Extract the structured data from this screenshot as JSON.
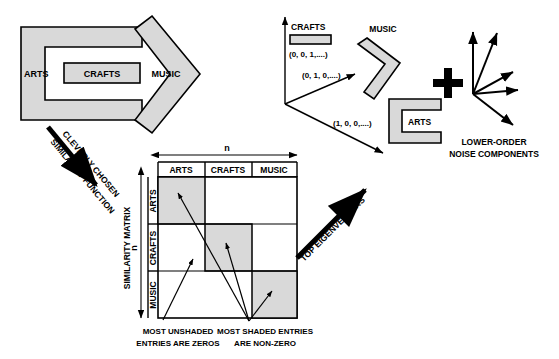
{
  "figure": {
    "title_present": false,
    "background": "#ffffff",
    "shade_color": "#d9d9d9",
    "stroke_color": "#000000"
  },
  "left_panel": {
    "name": "interlocking-shapes-group",
    "shapes": [
      {
        "id": "arts-c-shape",
        "label": "ARTS",
        "glyph": "c-bracket"
      },
      {
        "id": "crafts-bar-shape",
        "label": "CRAFTS",
        "glyph": "rectangle-bar"
      },
      {
        "id": "music-chevron-shape",
        "label": "MUSIC",
        "glyph": "chevron-right"
      }
    ]
  },
  "arrows": {
    "similarity": {
      "line1": "CLEVERLY CHOSEN",
      "line2": "SIMILARITY FUNCTION"
    },
    "eigenvectors": {
      "label": "TOP EIGENVECTORS"
    }
  },
  "matrix": {
    "name": "similarity-matrix",
    "top_axis_label": "n",
    "left_axis_label": "n",
    "side_caption": "SIMILARITY MATRIX",
    "column_headers": [
      "ARTS",
      "CRAFTS",
      "MUSIC"
    ],
    "row_headers": [
      "ARTS",
      "CRAFTS",
      "MUSIC"
    ],
    "blocks": [
      {
        "row": "ARTS",
        "col": "ARTS",
        "shaded": true
      },
      {
        "row": "ARTS",
        "col": "CRAFTS",
        "shaded": false
      },
      {
        "row": "ARTS",
        "col": "MUSIC",
        "shaded": false
      },
      {
        "row": "CRAFTS",
        "col": "ARTS",
        "shaded": false
      },
      {
        "row": "CRAFTS",
        "col": "CRAFTS",
        "shaded": true
      },
      {
        "row": "CRAFTS",
        "col": "MUSIC",
        "shaded": false
      },
      {
        "row": "MUSIC",
        "col": "ARTS",
        "shaded": false
      },
      {
        "row": "MUSIC",
        "col": "CRAFTS",
        "shaded": false
      },
      {
        "row": "MUSIC",
        "col": "MUSIC",
        "shaded": true
      }
    ],
    "annotations": {
      "unshaded": {
        "line1": "MOST UNSHADED",
        "line2": "ENTRIES ARE ZEROS"
      },
      "shaded": {
        "line1": "MOST SHADED ENTRIES",
        "line2": "ARE NON-ZERO"
      }
    }
  },
  "eigen_panel": {
    "name": "eigenvector-space",
    "vectors": [
      {
        "shape_label": "CRAFTS",
        "coords": "(0, 0, 1,....)",
        "glyph": "rectangle-bar"
      },
      {
        "shape_label": "MUSIC",
        "coords": "(0, 1, 0,....)",
        "glyph": "chevron-right"
      },
      {
        "shape_label": "ARTS",
        "coords": "(1, 0, 0,....)",
        "glyph": "c-bracket"
      }
    ],
    "plus_sign": "+",
    "noise": {
      "line1": "LOWER-ORDER",
      "line2": "NOISE COMPONENTS",
      "ray_count": 5
    }
  }
}
